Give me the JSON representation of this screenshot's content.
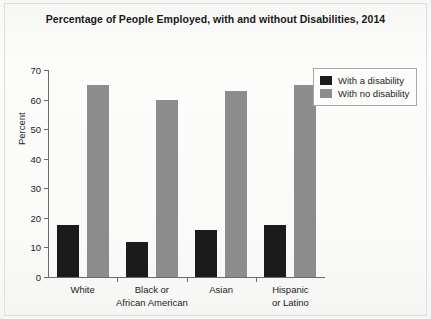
{
  "chart_data": {
    "type": "bar",
    "title": "Percentage of People Employed, with and without Disabilities, 2014",
    "xlabel": "",
    "ylabel": "Percent",
    "ylim": [
      0,
      70
    ],
    "yticks": [
      0,
      10,
      20,
      30,
      40,
      50,
      60,
      70
    ],
    "grid": false,
    "legend_position": "top-right",
    "categories": [
      "White",
      "Black or African American",
      "Asian",
      "Hispanic or Latino"
    ],
    "category_lines": [
      [
        "White"
      ],
      [
        "Black or",
        "African American"
      ],
      [
        "Asian"
      ],
      [
        "Hispanic",
        "or Latino"
      ]
    ],
    "series": [
      {
        "name": "With a disability",
        "color": "#1b1b1b",
        "values": [
          17.5,
          12,
          16,
          17.5
        ]
      },
      {
        "name": "With no disability",
        "color": "#8c8c8c",
        "values": [
          65,
          60,
          63,
          65
        ]
      }
    ]
  },
  "axis": {
    "y_tick_labels": [
      "0",
      "10",
      "20",
      "30",
      "40",
      "50",
      "60",
      "70"
    ],
    "y_title": "Percent"
  }
}
